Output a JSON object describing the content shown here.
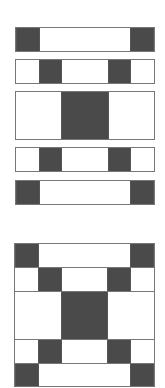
{
  "colors": {
    "dark": "#4a4a4a",
    "light": "#ffffff",
    "outline": "#777777"
  },
  "strips": [
    {
      "id": "row-1",
      "top": 27,
      "height": 25,
      "cells": [
        {
          "w": 24,
          "c": "dark"
        },
        {
          "w": 92,
          "c": "light"
        },
        {
          "w": 24,
          "c": "dark"
        }
      ]
    },
    {
      "id": "row-2",
      "top": 59,
      "height": 25,
      "cells": [
        {
          "w": 23,
          "c": "light"
        },
        {
          "w": 24,
          "c": "dark"
        },
        {
          "w": 46,
          "c": "light"
        },
        {
          "w": 24,
          "c": "dark"
        },
        {
          "w": 23,
          "c": "light"
        }
      ]
    },
    {
      "id": "row-3",
      "top": 91,
      "height": 49,
      "cells": [
        {
          "w": 46,
          "c": "light"
        },
        {
          "w": 48,
          "c": "dark"
        },
        {
          "w": 46,
          "c": "light"
        }
      ]
    },
    {
      "id": "row-4",
      "top": 147,
      "height": 25,
      "cells": [
        {
          "w": 23,
          "c": "light"
        },
        {
          "w": 24,
          "c": "dark"
        },
        {
          "w": 46,
          "c": "light"
        },
        {
          "w": 24,
          "c": "dark"
        },
        {
          "w": 23,
          "c": "light"
        }
      ]
    },
    {
      "id": "row-5",
      "top": 180,
      "height": 25,
      "cells": [
        {
          "w": 24,
          "c": "dark"
        },
        {
          "w": 92,
          "c": "light"
        },
        {
          "w": 24,
          "c": "dark"
        }
      ]
    }
  ],
  "assembled_block": {
    "rows": [
      {
        "top": 0,
        "height": 24,
        "cells": [
          {
            "w": 24,
            "c": "dark"
          },
          {
            "w": 92,
            "c": "light"
          },
          {
            "w": 24,
            "c": "dark"
          }
        ]
      },
      {
        "top": 24,
        "height": 24,
        "cells": [
          {
            "w": 23,
            "c": "light"
          },
          {
            "w": 24,
            "c": "dark"
          },
          {
            "w": 46,
            "c": "light"
          },
          {
            "w": 24,
            "c": "dark"
          },
          {
            "w": 23,
            "c": "light"
          }
        ]
      },
      {
        "top": 48,
        "height": 48,
        "cells": [
          {
            "w": 46,
            "c": "light"
          },
          {
            "w": 48,
            "c": "dark"
          },
          {
            "w": 46,
            "c": "light"
          }
        ]
      },
      {
        "top": 96,
        "height": 24,
        "cells": [
          {
            "w": 23,
            "c": "light"
          },
          {
            "w": 24,
            "c": "dark"
          },
          {
            "w": 46,
            "c": "light"
          },
          {
            "w": 24,
            "c": "dark"
          },
          {
            "w": 23,
            "c": "light"
          }
        ]
      },
      {
        "top": 120,
        "height": 22,
        "cells": [
          {
            "w": 24,
            "c": "dark"
          },
          {
            "w": 92,
            "c": "light"
          },
          {
            "w": 24,
            "c": "dark"
          }
        ]
      }
    ]
  }
}
